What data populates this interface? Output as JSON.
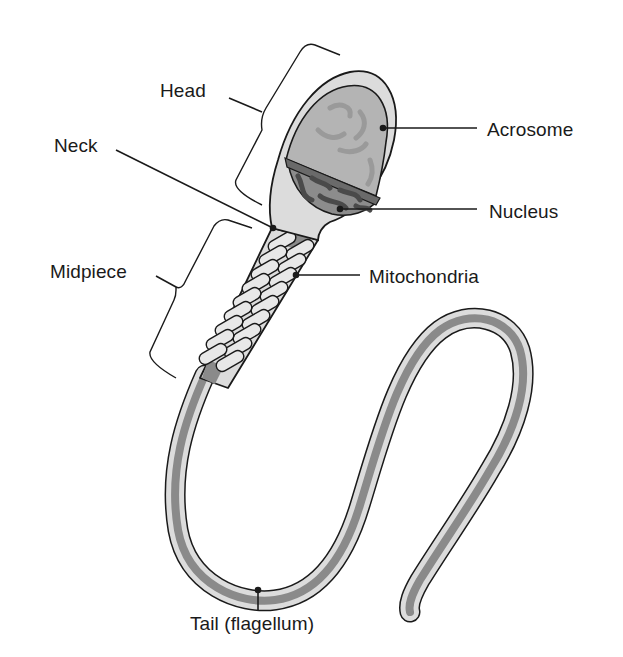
{
  "diagram": {
    "colors": {
      "background": "#ffffff",
      "outline": "#1a1a1a",
      "membrane_fill": "#dcdcdc",
      "acrosome_fill": "#b4b4b4",
      "nucleus_fill": "#8c8c8c",
      "chromatin": "#5a5a5a",
      "axial_core": "#8a8a8a",
      "mitochondria_fill": "#e6e6e6",
      "leader_line": "#1a1a1a"
    },
    "labels": {
      "head": "Head",
      "neck": "Neck",
      "midpiece": "Midpiece",
      "acrosome": "Acrosome",
      "nucleus": "Nucleus",
      "mitochondria": "Mitochondria",
      "tail": "Tail (flagellum)"
    }
  }
}
